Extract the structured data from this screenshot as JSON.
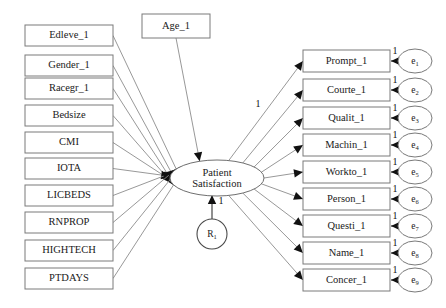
{
  "diagram": {
    "background_color": "#ffffff",
    "line_color": "#8c8c8c",
    "box_stroke_color": "#7a7a7a",
    "text_color": "#1a1a1a",
    "latent": {
      "label_line1": "Patient",
      "label_line2": "Satisfaction",
      "cx": 217,
      "cy": 178,
      "rx": 47,
      "ry": 18
    },
    "residual": {
      "label": "R",
      "subscript": "1",
      "cx": 212,
      "cy": 234,
      "r": 15,
      "path_coefficient": "1"
    },
    "first_loading_label": "1",
    "predictors": [
      {
        "label": "Edleve_1",
        "x": 25,
        "y": 25
      },
      {
        "label": "Gender_1",
        "x": 25,
        "y": 55
      },
      {
        "label": "Racegr_1",
        "x": 25,
        "y": 78
      },
      {
        "label": "Bedsize",
        "x": 25,
        "y": 105
      },
      {
        "label": "CMI",
        "x": 25,
        "y": 132
      },
      {
        "label": "IOTA",
        "x": 25,
        "y": 158
      },
      {
        "label": "LICBEDS",
        "x": 25,
        "y": 185
      },
      {
        "label": "RNPROP",
        "x": 25,
        "y": 212
      },
      {
        "label": "HIGHTECH",
        "x": 25,
        "y": 240
      },
      {
        "label": "PTDAYS",
        "x": 25,
        "y": 268
      }
    ],
    "predictor_box": {
      "width": 88,
      "height": 21
    },
    "top_predictor": {
      "label": "Age_1",
      "x": 142,
      "y": 14,
      "width": 68,
      "height": 24
    },
    "indicators": [
      {
        "label": "Prompt_1",
        "y": 50,
        "error": "e",
        "error_subscript": "1",
        "error_coefficient": "1"
      },
      {
        "label": "Courte_1",
        "y": 79,
        "error": "e",
        "error_subscript": "2",
        "error_coefficient": "1"
      },
      {
        "label": "Qualit_1",
        "y": 107,
        "error": "e",
        "error_subscript": "3",
        "error_coefficient": "1"
      },
      {
        "label": "Machin_1",
        "y": 134,
        "error": "e",
        "error_subscript": "4",
        "error_coefficient": "1"
      },
      {
        "label": "Workto_1",
        "y": 161,
        "error": "e",
        "error_subscript": "5",
        "error_coefficient": "1"
      },
      {
        "label": "Person_1",
        "y": 188,
        "error": "e",
        "error_subscript": "6",
        "error_coefficient": "1"
      },
      {
        "label": "Questi_1",
        "y": 215,
        "error": "e",
        "error_subscript": "7",
        "error_coefficient": "1"
      },
      {
        "label": "Name_1",
        "y": 242,
        "error": "e",
        "error_subscript": "8",
        "error_coefficient": "1"
      },
      {
        "label": "Concer_1",
        "y": 269,
        "error": "e",
        "error_subscript": "9",
        "error_coefficient": "1"
      }
    ],
    "indicator_box": {
      "x": 303,
      "width": 87,
      "height": 22
    },
    "error_ellipse": {
      "cx": 415,
      "rx": 17,
      "ry": 12
    }
  }
}
